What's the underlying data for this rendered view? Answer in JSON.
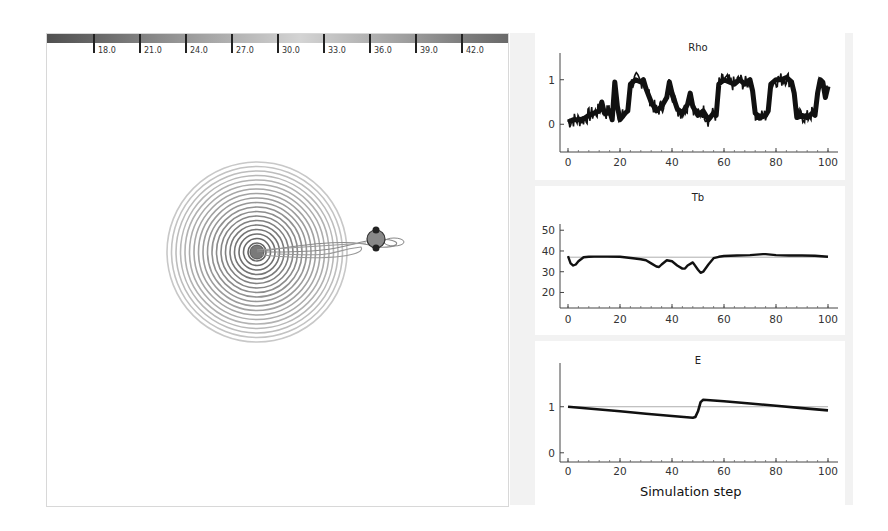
{
  "colorbar": {
    "ticks": [
      "18.0",
      "21.0",
      "24.0",
      "27.0",
      "30.0",
      "33.0",
      "36.0",
      "39.0",
      "42.0"
    ]
  },
  "simulation_view": {
    "contour_center": [
      256,
      251
    ],
    "contour_rings": 20,
    "agent_position": [
      375,
      238
    ]
  },
  "chart_data": [
    {
      "type": "line",
      "title": "Rho",
      "xlabel": "",
      "ylabel": "",
      "x_ticks": [
        "0",
        "20",
        "40",
        "60",
        "80",
        "100"
      ],
      "y_ticks": [
        "0",
        "1"
      ],
      "xlim": [
        0,
        100
      ],
      "ylim": [
        -0.6,
        1.6
      ],
      "reference_line": null,
      "series": [
        {
          "name": "Rho",
          "x": [
            0,
            2,
            4,
            6,
            8,
            10,
            12,
            13,
            14,
            16,
            17,
            18,
            19,
            20,
            22,
            23,
            24,
            26,
            28,
            29,
            30,
            32,
            34,
            36,
            38,
            39,
            40,
            42,
            44,
            46,
            47,
            48,
            50,
            52,
            54,
            56,
            57,
            58,
            60,
            62,
            64,
            66,
            68,
            70,
            71,
            72,
            74,
            76,
            77,
            78,
            80,
            82,
            84,
            86,
            87,
            88,
            90,
            92,
            94,
            95,
            96,
            97,
            98,
            99,
            100
          ],
          "values": [
            0.05,
            0.1,
            0.1,
            0.12,
            0.2,
            0.25,
            0.3,
            0.5,
            0.25,
            0.3,
            0.1,
            0.95,
            0.4,
            0.1,
            0.25,
            0.3,
            0.9,
            1.0,
            0.95,
            1.0,
            0.8,
            0.5,
            0.3,
            0.4,
            0.6,
            0.95,
            0.7,
            0.35,
            0.25,
            0.45,
            0.7,
            0.4,
            0.2,
            0.3,
            0.1,
            0.25,
            0.2,
            0.9,
            1.0,
            0.95,
            0.9,
            1.0,
            0.9,
            1.0,
            0.75,
            0.25,
            0.15,
            0.2,
            0.3,
            0.9,
            1.0,
            1.0,
            1.05,
            0.95,
            0.7,
            0.15,
            0.2,
            0.15,
            0.25,
            0.2,
            0.7,
            1.0,
            0.95,
            0.6,
            0.85
          ]
        }
      ]
    },
    {
      "type": "line",
      "title": "Tb",
      "xlabel": "",
      "ylabel": "",
      "x_ticks": [
        "0",
        "20",
        "40",
        "60",
        "80",
        "100"
      ],
      "y_ticks": [
        "20",
        "30",
        "40",
        "50"
      ],
      "xlim": [
        0,
        100
      ],
      "ylim": [
        13,
        53
      ],
      "reference_line": 37,
      "series": [
        {
          "name": "Tb",
          "x": [
            0,
            1,
            2,
            3,
            4,
            5,
            6,
            8,
            10,
            15,
            20,
            25,
            28,
            30,
            32,
            34,
            35,
            36,
            38,
            40,
            42,
            44,
            45,
            46,
            48,
            50,
            51,
            52,
            54,
            56,
            58,
            60,
            65,
            70,
            75,
            76,
            80,
            85,
            90,
            95,
            100
          ],
          "values": [
            37.5,
            34,
            33,
            33.5,
            35,
            36,
            37,
            37.2,
            37.3,
            37.3,
            37.2,
            36.5,
            36,
            35.5,
            34,
            32.5,
            32.3,
            33.5,
            35.5,
            35,
            33,
            31.5,
            31.5,
            33,
            34.5,
            31,
            29.5,
            30,
            33.5,
            36.5,
            37.2,
            37.6,
            37.8,
            38,
            38.5,
            38.5,
            38,
            37.8,
            37.8,
            37.7,
            37.2
          ]
        }
      ]
    },
    {
      "type": "line",
      "title": "E",
      "xlabel": "Simulation step",
      "ylabel": "",
      "x_ticks": [
        "0",
        "20",
        "40",
        "60",
        "80",
        "100"
      ],
      "y_ticks": [
        "0",
        "1"
      ],
      "xlim": [
        0,
        100
      ],
      "ylim": [
        -0.2,
        1.95
      ],
      "reference_line": 1,
      "series": [
        {
          "name": "E",
          "x": [
            0,
            10,
            20,
            30,
            40,
            48,
            49,
            50,
            51,
            52,
            60,
            70,
            80,
            90,
            100
          ],
          "values": [
            1.0,
            0.95,
            0.9,
            0.85,
            0.8,
            0.76,
            0.78,
            0.9,
            1.1,
            1.15,
            1.12,
            1.07,
            1.02,
            0.97,
            0.92
          ]
        }
      ]
    }
  ]
}
